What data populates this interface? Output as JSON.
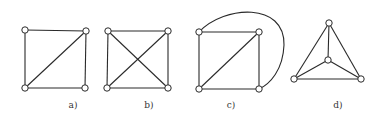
{
  "figure": {
    "graphs": [
      {
        "id": "a",
        "label": "a)",
        "nodes": [
          [
            25,
            30
          ],
          [
            86,
            31
          ],
          [
            25,
            88
          ],
          [
            85,
            88
          ]
        ],
        "edges": [
          [
            0,
            1
          ],
          [
            0,
            2
          ],
          [
            1,
            3
          ],
          [
            2,
            3
          ],
          [
            1,
            2
          ]
        ]
      },
      {
        "id": "b",
        "label": "b)",
        "nodes": [
          [
            108,
            31
          ],
          [
            168,
            31
          ],
          [
            107,
            88
          ],
          [
            168,
            88
          ]
        ],
        "edges": [
          [
            0,
            1
          ],
          [
            0,
            2
          ],
          [
            1,
            3
          ],
          [
            2,
            3
          ],
          [
            0,
            3
          ],
          [
            1,
            2
          ]
        ]
      },
      {
        "id": "c",
        "label": "c)",
        "nodes": [
          [
            199,
            32
          ],
          [
            259,
            32
          ],
          [
            199,
            89
          ],
          [
            259,
            89
          ]
        ],
        "edges": [
          [
            0,
            1
          ],
          [
            0,
            2
          ],
          [
            1,
            3
          ],
          [
            2,
            3
          ],
          [
            1,
            2
          ]
        ],
        "curved_edge": {
          "from": 0,
          "to": 3,
          "path": "M199,32 C225,5 285,2 284,45 C283,70 270,84 259,89"
        }
      },
      {
        "id": "d",
        "label": "d)",
        "nodes": [
          [
            329,
            23
          ],
          [
            328,
            60
          ],
          [
            294,
            79
          ],
          [
            361,
            79
          ]
        ],
        "edges": [
          [
            0,
            2
          ],
          [
            0,
            3
          ],
          [
            2,
            3
          ],
          [
            0,
            1
          ],
          [
            1,
            2
          ],
          [
            1,
            3
          ]
        ]
      }
    ],
    "label_positions": [
      [
        73,
        108
      ],
      [
        149,
        108
      ],
      [
        231,
        108
      ],
      [
        338,
        108
      ]
    ],
    "node_radius": 3.2
  }
}
